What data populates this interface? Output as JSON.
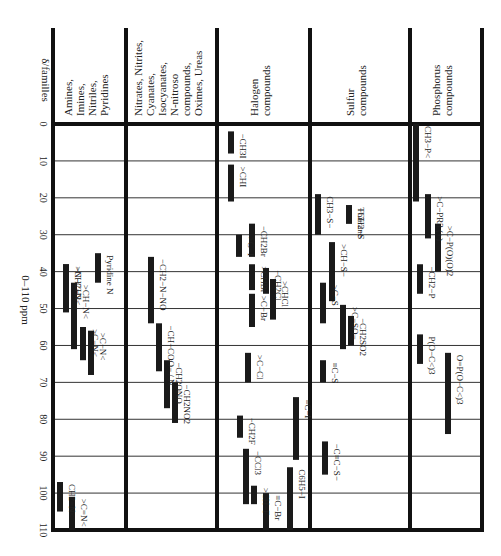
{
  "chart_data": {
    "type": "range-bar",
    "title": "",
    "corner_label": "δ/familles",
    "ylabel": "0–110 ppm",
    "ylim": [
      0,
      110
    ],
    "y_ticks": [
      0,
      10,
      20,
      30,
      40,
      50,
      60,
      70,
      80,
      90,
      100,
      110
    ],
    "grid": true,
    "orientation": "vertical (ppm increases downward)",
    "columns": [
      {
        "name": "Amines, Imines, Nitriles, Pyridines",
        "header_lines": [
          "Amines,",
          "Imines,",
          "Nitriles,",
          "Pyridines"
        ],
        "ranges": [
          {
            "label": "−CH2−N<",
            "start": 38,
            "end": 51
          },
          {
            "label": ">N−CH3",
            "start": 38,
            "end": 51
          },
          {
            "label": ">CH−N<",
            "start": 43,
            "end": 61
          },
          {
            "label": ">C−N<",
            "start": 55,
            "end": 64
          },
          {
            "label": ">C−N<",
            "start": 56,
            "end": 68
          },
          {
            "label": "Pyridine N",
            "start": 35,
            "end": 43
          },
          {
            "label": "CH2=N<",
            "start": 97,
            "end": 105
          },
          {
            "label": ">C=N<",
            "start": 101,
            "end": 110
          }
        ]
      },
      {
        "name": "Nitrates, Nitrites, Cyanates, Isocyanates, N-nitroso compounds, Oximes, Ureas",
        "header_lines": [
          "Nitrates, Nitrites,",
          "Cyanates,",
          "Isocyanates,",
          "N-nitroso",
          "compounds,",
          "Oximes, Ureas"
        ],
        "ranges": [
          {
            "label": "−CH2−N−NO",
            "start": 36,
            "end": 54
          },
          {
            "label": "−CH−COO− / N",
            "start": 54,
            "end": 67
          },
          {
            "label": "−CH2ONO",
            "start": 64,
            "end": 77
          },
          {
            "label": "−CH2NO2",
            "start": 70,
            "end": 81
          }
        ]
      },
      {
        "name": "Halogen compounds",
        "header_lines": [
          "Halogen",
          "compounds"
        ],
        "ranges": [
          {
            "label": "−CH3I",
            "start": 2,
            "end": 8
          },
          {
            "label": ">CHI",
            "start": 11,
            "end": 21
          },
          {
            "label": ">C−I",
            "start": 30,
            "end": 36
          },
          {
            "label": "−CH2Br",
            "start": 27,
            "end": 36
          },
          {
            "label": ">CHBr",
            "start": 38,
            "end": 45
          },
          {
            "label": ">C−Br",
            "start": 46,
            "end": 55
          },
          {
            "label": "−CH2Cl",
            "start": 39,
            "end": 46
          },
          {
            "label": ">CHCl",
            "start": 42,
            "end": 53
          },
          {
            "label": ">C−Cl",
            "start": 62,
            "end": 70
          },
          {
            "label": "≡C−I",
            "start": 74,
            "end": 91
          },
          {
            "label": "−CH2F",
            "start": 79,
            "end": 85
          },
          {
            "label": "−CCl3",
            "start": 88,
            "end": 103
          },
          {
            "label": ">CH−F",
            "start": 98,
            "end": 103
          },
          {
            "label": "≡C−Br",
            "start": 100,
            "end": 110
          },
          {
            "label": "C6H5−I",
            "start": 93,
            "end": 110
          }
        ]
      },
      {
        "name": "Sulfur compounds",
        "header_lines": [
          "Sulfur",
          "compounds"
        ],
        "ranges": [
          {
            "label": "CH3−S−",
            "start": 19,
            "end": 30
          },
          {
            "label": "−CH2−S",
            "start": 22,
            "end": 27
          },
          {
            "label": "Thiirane",
            "start": 22,
            "end": 27
          },
          {
            "label": ">CH−S−",
            "start": 32,
            "end": 48
          },
          {
            "label": ">C−S",
            "start": 43,
            "end": 54
          },
          {
            "label": ">C−SO−",
            "start": 49,
            "end": 61
          },
          {
            "label": "−CH2SO2",
            "start": 52,
            "end": 60
          },
          {
            "label": "≡C−S",
            "start": 64,
            "end": 70
          },
          {
            "label": "−C≡C−S−",
            "start": 86,
            "end": 95
          }
        ]
      },
      {
        "name": "Phosphorus compounds",
        "header_lines": [
          "Phosphorus",
          "compounds"
        ],
        "ranges": [
          {
            "label": "CH3−P<",
            "start": 0,
            "end": 21
          },
          {
            "label": ">C−PR3 (+)",
            "start": 19,
            "end": 31
          },
          {
            "label": ">C−P(O)(O)2",
            "start": 27,
            "end": 40
          },
          {
            "label": "−CH2−P",
            "start": 38,
            "end": 46
          },
          {
            "label": "P(O−C<)3",
            "start": 57,
            "end": 65
          },
          {
            "label": "O=P(O−C<)3",
            "start": 62,
            "end": 84
          }
        ]
      }
    ]
  }
}
